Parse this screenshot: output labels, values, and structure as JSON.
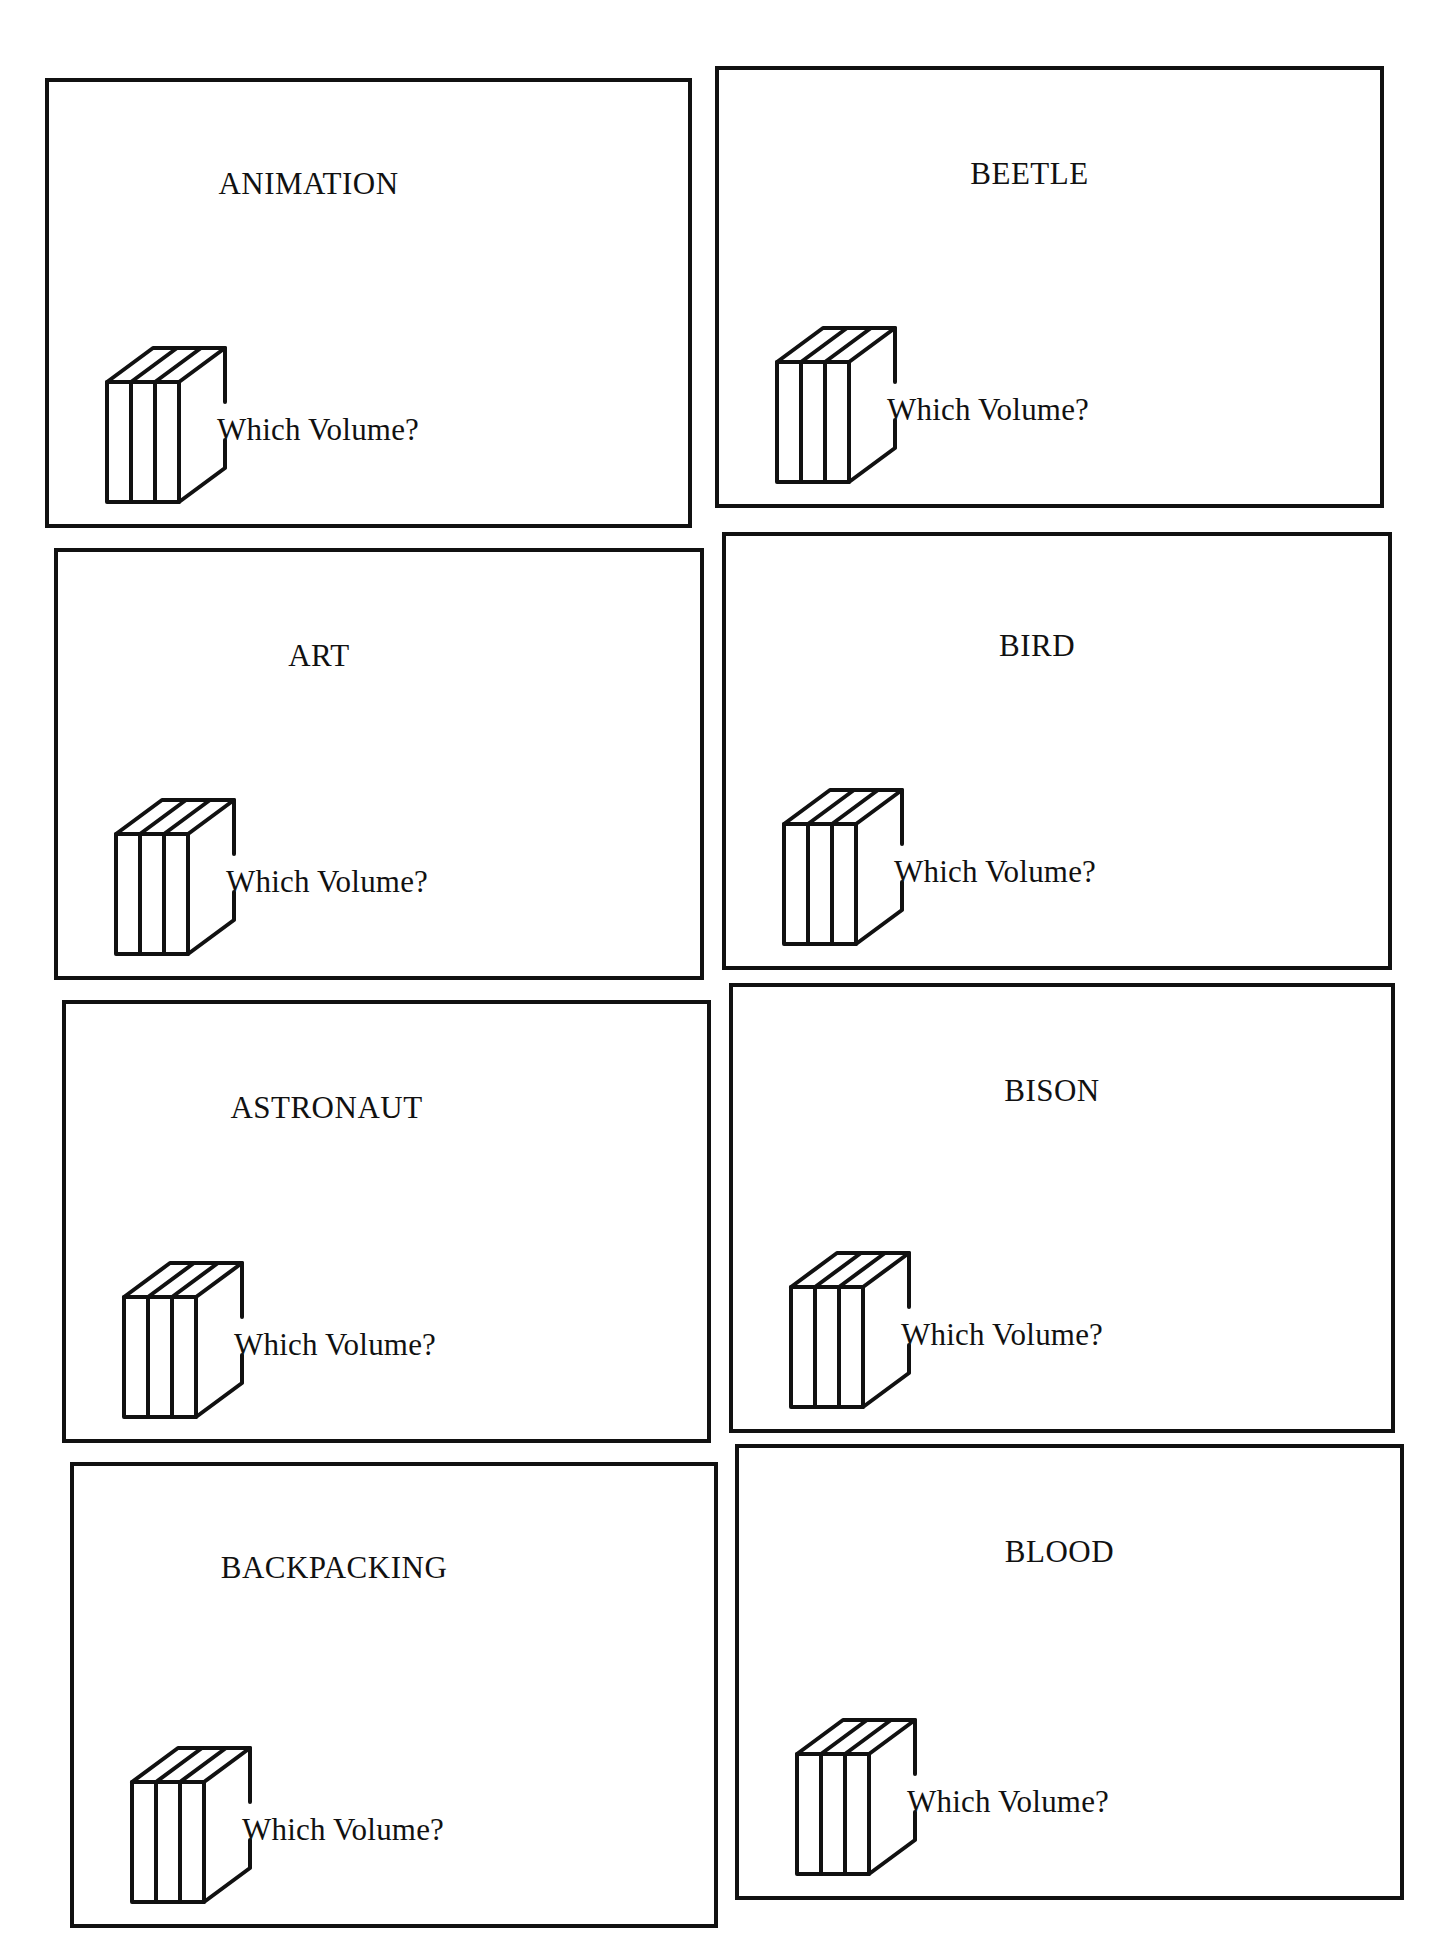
{
  "sheet": {
    "question_label": "Which Volume?",
    "icon": "books-icon",
    "cards": [
      {
        "title": "ANIMATION",
        "box": [
          45,
          78,
          647,
          450
        ],
        "title_offset": [
          -60,
          110
        ]
      },
      {
        "title": "BEETLE",
        "box": [
          715,
          66,
          669,
          442
        ],
        "title_offset": [
          -20,
          112
        ]
      },
      {
        "title": "ART",
        "box": [
          54,
          548,
          650,
          432
        ],
        "title_offset": [
          -60,
          112
        ]
      },
      {
        "title": "BIRD",
        "box": [
          722,
          532,
          670,
          438
        ],
        "title_offset": [
          -20,
          118
        ]
      },
      {
        "title": "ASTRONAUT",
        "box": [
          62,
          1000,
          649,
          443
        ],
        "title_offset": [
          -60,
          112
        ]
      },
      {
        "title": "BISON",
        "box": [
          729,
          983,
          666,
          450
        ],
        "title_offset": [
          -10,
          112
        ]
      },
      {
        "title": "BACKPACKING",
        "box": [
          70,
          1462,
          648,
          466
        ],
        "title_offset": [
          -60,
          110
        ]
      },
      {
        "title": "BLOOD",
        "box": [
          735,
          1444,
          669,
          456
        ],
        "title_offset": [
          -10,
          112
        ]
      }
    ]
  }
}
